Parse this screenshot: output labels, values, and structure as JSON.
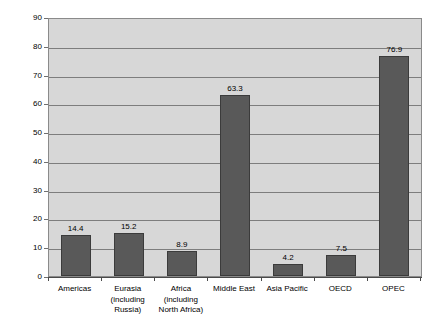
{
  "chart_data": {
    "type": "bar",
    "title": "",
    "xlabel": "",
    "ylabel": "Percentage of world reserves",
    "ylim": [
      0,
      90
    ],
    "yticks": [
      0,
      10,
      20,
      30,
      40,
      50,
      60,
      70,
      80,
      90
    ],
    "grid": true,
    "legend": "none",
    "categories": [
      "Americas",
      "Eurasia (including Russia)",
      "Africa (including North Africa)",
      "Middle East",
      "Asia Pacific",
      "OECD",
      "OPEC"
    ],
    "category_lines": [
      [
        "Americas"
      ],
      [
        "Eurasia",
        "(including",
        "Russia)"
      ],
      [
        "Africa",
        "(including",
        "North Africa)"
      ],
      [
        "Middle East"
      ],
      [
        "Asia Pacific"
      ],
      [
        "OECD"
      ],
      [
        "OPEC"
      ]
    ],
    "values": [
      14.4,
      15.2,
      8.9,
      63.3,
      4.2,
      7.5,
      76.9
    ],
    "value_labels": [
      "14.4",
      "15.2",
      "8.9",
      "63.3",
      "4.2",
      "7.5",
      "76.9"
    ],
    "colors": {
      "bar_fill": "#595959",
      "bar_border": "#3b3b3b",
      "plot_background": "#d7d7d7",
      "gridline": "#7d7d7d",
      "axis": "#4a4a4a",
      "text": "#000000"
    }
  },
  "caption": {
    "text": ""
  }
}
